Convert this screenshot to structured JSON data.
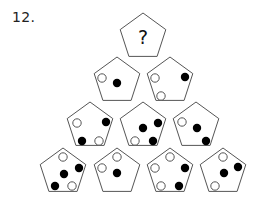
{
  "puzzle": {
    "number_label": "12.",
    "question_mark": "?",
    "colors": {
      "stroke": "#555555",
      "black_dot": "#000000",
      "white_dot_fill": "#ffffff",
      "white_dot_stroke": "#555555"
    },
    "rows": [
      {
        "row": 1,
        "pentagons": [
          {
            "id": "p1-1",
            "cx": 143,
            "cy": 37,
            "content": "?",
            "dots": []
          }
        ]
      },
      {
        "row": 2,
        "pentagons": [
          {
            "id": "p2-1",
            "cx": 117,
            "cy": 81,
            "dots": [
              {
                "x": 102,
                "y": 78,
                "color": "white"
              },
              {
                "x": 117,
                "y": 83,
                "color": "black"
              }
            ]
          },
          {
            "id": "p2-2",
            "cx": 170,
            "cy": 81,
            "dots": [
              {
                "x": 155,
                "y": 78,
                "color": "white"
              },
              {
                "x": 185,
                "y": 77,
                "color": "black"
              },
              {
                "x": 161,
                "y": 96,
                "color": "white"
              }
            ]
          }
        ]
      },
      {
        "row": 3,
        "pentagons": [
          {
            "id": "p3-1",
            "cx": 90,
            "cy": 126,
            "dots": [
              {
                "x": 77,
                "y": 123,
                "color": "white"
              },
              {
                "x": 106,
                "y": 122,
                "color": "black"
              },
              {
                "x": 82,
                "y": 141,
                "color": "black"
              },
              {
                "x": 99,
                "y": 141,
                "color": "white"
              }
            ]
          },
          {
            "id": "p3-2",
            "cx": 143,
            "cy": 126,
            "dots": [
              {
                "x": 158,
                "y": 123,
                "color": "black"
              },
              {
                "x": 143,
                "y": 128,
                "color": "black"
              },
              {
                "x": 153,
                "y": 141,
                "color": "black"
              },
              {
                "x": 135,
                "y": 141,
                "color": "white"
              }
            ]
          },
          {
            "id": "p3-3",
            "cx": 196,
            "cy": 126,
            "dots": [
              {
                "x": 182,
                "y": 122,
                "color": "white"
              },
              {
                "x": 197,
                "y": 128,
                "color": "black"
              },
              {
                "x": 206,
                "y": 141,
                "color": "black"
              }
            ]
          }
        ]
      },
      {
        "row": 4,
        "pentagons": [
          {
            "id": "p4-1",
            "cx": 63,
            "cy": 172,
            "dots": [
              {
                "x": 63,
                "y": 157,
                "color": "white"
              },
              {
                "x": 79,
                "y": 168,
                "color": "black"
              },
              {
                "x": 64,
                "y": 174,
                "color": "black"
              },
              {
                "x": 55,
                "y": 186,
                "color": "black"
              },
              {
                "x": 72,
                "y": 186,
                "color": "white"
              }
            ]
          },
          {
            "id": "p4-2",
            "cx": 117,
            "cy": 172,
            "dots": [
              {
                "x": 117,
                "y": 157,
                "color": "white"
              },
              {
                "x": 102,
                "y": 168,
                "color": "white"
              },
              {
                "x": 117,
                "y": 173,
                "color": "black"
              }
            ]
          },
          {
            "id": "p4-3",
            "cx": 170,
            "cy": 172,
            "dots": [
              {
                "x": 170,
                "y": 157,
                "color": "white"
              },
              {
                "x": 155,
                "y": 168,
                "color": "white"
              },
              {
                "x": 185,
                "y": 168,
                "color": "black"
              },
              {
                "x": 161,
                "y": 186,
                "color": "white"
              },
              {
                "x": 179,
                "y": 186,
                "color": "black"
              }
            ]
          },
          {
            "id": "p4-4",
            "cx": 223,
            "cy": 172,
            "dots": [
              {
                "x": 223,
                "y": 157,
                "color": "white"
              },
              {
                "x": 238,
                "y": 167,
                "color": "black"
              },
              {
                "x": 224,
                "y": 173,
                "color": "black"
              },
              {
                "x": 215,
                "y": 186,
                "color": "white"
              }
            ]
          }
        ]
      }
    ]
  }
}
